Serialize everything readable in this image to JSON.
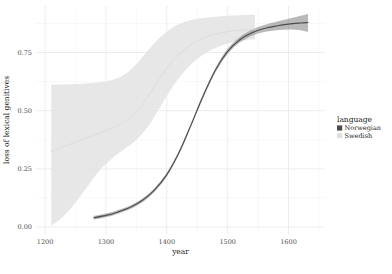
{
  "chart_data": {
    "type": "line",
    "title": "",
    "subtitle": "",
    "xlabel": "year",
    "ylabel": "loss of lexical genitives",
    "xlim": [
      1185,
      1660
    ],
    "ylim": [
      -0.03,
      0.95
    ],
    "x_ticks": [
      1200,
      1300,
      1400,
      1500,
      1600
    ],
    "x_tick_labels": [
      "1200",
      "1300",
      "1400",
      "1500",
      "1600"
    ],
    "y_ticks": [
      0.0,
      0.25,
      0.5,
      0.75
    ],
    "y_tick_labels": [
      "0.00",
      "0.25",
      "0.50",
      "0.75"
    ],
    "x_minor_ticks": [
      1250,
      1350,
      1450,
      1550,
      1650
    ],
    "y_minor_ticks": [
      0.125,
      0.375,
      0.625,
      0.875
    ],
    "grid": true,
    "legend_position": "right",
    "legend_title": "language",
    "panel_background": "#ffffff",
    "grid_color": "#ebebeb",
    "series": [
      {
        "name": "Norwegian",
        "color": "#4d4d4d",
        "ribbon_color": "#808080",
        "ribbon_opacity": 0.55,
        "x": [
          1280,
          1300,
          1320,
          1340,
          1360,
          1380,
          1400,
          1420,
          1440,
          1460,
          1480,
          1500,
          1520,
          1540,
          1560,
          1580,
          1600,
          1620,
          1632
        ],
        "values": [
          0.04,
          0.05,
          0.065,
          0.085,
          0.115,
          0.16,
          0.225,
          0.32,
          0.44,
          0.565,
          0.675,
          0.755,
          0.805,
          0.835,
          0.853,
          0.864,
          0.872,
          0.877,
          0.879
        ],
        "ci_lower": [
          0.032,
          0.042,
          0.057,
          0.077,
          0.107,
          0.152,
          0.217,
          0.312,
          0.432,
          0.556,
          0.665,
          0.744,
          0.793,
          0.822,
          0.838,
          0.846,
          0.849,
          0.846,
          0.838
        ],
        "ci_upper": [
          0.048,
          0.058,
          0.073,
          0.093,
          0.123,
          0.168,
          0.233,
          0.328,
          0.448,
          0.574,
          0.685,
          0.766,
          0.817,
          0.848,
          0.868,
          0.882,
          0.895,
          0.908,
          0.916
        ]
      },
      {
        "name": "Swedish",
        "color": "#d9d9d9",
        "ribbon_color": "#e3e3e3",
        "ribbon_opacity": 0.85,
        "x": [
          1210,
          1230,
          1250,
          1270,
          1290,
          1310,
          1330,
          1350,
          1370,
          1390,
          1410,
          1430,
          1450,
          1470,
          1490,
          1510,
          1530,
          1545
        ],
        "values": [
          0.325,
          0.345,
          0.365,
          0.385,
          0.405,
          0.425,
          0.452,
          0.495,
          0.565,
          0.645,
          0.715,
          0.765,
          0.8,
          0.822,
          0.835,
          0.843,
          0.848,
          0.85
        ],
        "ci_lower": [
          0.005,
          0.045,
          0.105,
          0.175,
          0.245,
          0.295,
          0.335,
          0.375,
          0.435,
          0.52,
          0.605,
          0.672,
          0.722,
          0.757,
          0.78,
          0.795,
          0.803,
          0.807
        ],
        "ci_upper": [
          0.612,
          0.613,
          0.615,
          0.618,
          0.622,
          0.632,
          0.655,
          0.7,
          0.762,
          0.818,
          0.858,
          0.882,
          0.895,
          0.902,
          0.906,
          0.909,
          0.911,
          0.912
        ]
      }
    ]
  },
  "legend": {
    "title": "language",
    "items": [
      {
        "label": "Norwegian",
        "color": "#4d4d4d"
      },
      {
        "label": "Swedish",
        "color": "#e0e0e0"
      }
    ]
  },
  "axes": {
    "x_title": "year",
    "y_title": "loss of lexical genitives"
  }
}
